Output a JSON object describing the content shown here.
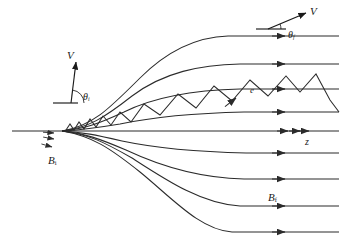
{
  "figure": {
    "background_color": "#ffffff",
    "line_color": "#2b2b2b"
  },
  "labels": {
    "v_initial": "V",
    "theta_initial_base": "θ",
    "theta_initial_sub": "i",
    "v_final": "V",
    "theta_final_base": "θ",
    "theta_final_sub": "f",
    "b_initial_base": "B",
    "b_initial_sub": "i",
    "b_final_base": "B",
    "b_final_sub": "f",
    "electron": "e",
    "axis": "z"
  },
  "chart_data": {
    "type": "line",
    "xlabel": "z",
    "ylabel": "",
    "xlim": [
      0,
      347
    ],
    "ylim": [
      242,
      0
    ],
    "grid": false,
    "legend": "none",
    "pinch_point": [
      62,
      131
    ],
    "field_lines_above": [
      {
        "name": "above-4",
        "asymptote_y": 36,
        "path": "M 62,131 C 92,126 108,110 140,78 C 168,50 196,37 228,36 L 339,36"
      },
      {
        "name": "above-3",
        "asymptote_y": 64,
        "path": "M 62,131 C 88,128 104,118 132,96 C 164,72 200,65 240,64 L 339,64"
      },
      {
        "name": "above-2",
        "asymptote_y": 89,
        "path": "M 62,131 C 84,129 98,124 124,112 C 156,96 198,90 240,89 L 339,89"
      },
      {
        "name": "above-1",
        "asymptote_y": 112,
        "path": "M 62,131 C 82,130 96,128 120,124 C 158,116 200,113 244,112 L 339,112"
      }
    ],
    "field_lines_below": [
      {
        "name": "below-1",
        "asymptote_y": 153,
        "path": "M 62,131 C 82,132 96,135 122,141 C 160,149 202,152 246,153 L 339,153"
      },
      {
        "name": "below-2",
        "asymptote_y": 179,
        "path": "M 62,131 C 84,133 100,139 126,150 C 160,166 200,178 244,179 L 339,179"
      },
      {
        "name": "below-3",
        "asymptote_y": 206,
        "path": "M 62,131 C 88,134 104,142 132,158 C 166,180 202,204 240,206 L 339,206"
      },
      {
        "name": "below-4",
        "asymptote_y": 232,
        "path": "M 62,131 C 92,136 110,148 140,172 C 172,198 200,230 232,232 L 339,232"
      }
    ],
    "axis_line": {
      "name": "z-axis",
      "y": 131,
      "x_start": 12,
      "x_end": 339
    },
    "arrowheads_x": 285,
    "axis_double_arrow_x": [
      288,
      300,
      309
    ],
    "electron_orbit": {
      "description": "Helical orbit projected as a zigzag: tight small-amplitude gyrations at the strong-field pinch growing to large-amplitude, long-pitch oscillations in the weak field region.",
      "points": [
        [
          66,
          130
        ],
        [
          70,
          124
        ],
        [
          74,
          130
        ],
        [
          79,
          122
        ],
        [
          84,
          129
        ],
        [
          90,
          119
        ],
        [
          96,
          127
        ],
        [
          103,
          116
        ],
        [
          111,
          125
        ],
        [
          120,
          112
        ],
        [
          131,
          122
        ],
        [
          144,
          104
        ],
        [
          160,
          115
        ],
        [
          178,
          94
        ],
        [
          196,
          108
        ],
        [
          214,
          86
        ],
        [
          232,
          101
        ],
        [
          250,
          80
        ],
        [
          268,
          96
        ],
        [
          286,
          76
        ],
        [
          300,
          92
        ],
        [
          316,
          74
        ],
        [
          330,
          100
        ],
        [
          339,
          112
        ]
      ],
      "direction_arrow_at": [
        236,
        98
      ],
      "direction_arrow_angle": -38
    },
    "small_arrows_near_pinch": [
      {
        "x": 54,
        "y": 139,
        "angle": 10
      },
      {
        "x": 52,
        "y": 147,
        "angle": 16
      },
      {
        "x": 54,
        "y": 133,
        "angle": 4
      }
    ],
    "vector_initial": {
      "origin": [
        71,
        103
      ],
      "tip": [
        76,
        62
      ],
      "baseline_from": [
        53,
        103
      ],
      "baseline_to": [
        78,
        103
      ],
      "angle_label_at": [
        84,
        97
      ],
      "pitch_angle_deg": 78
    },
    "vector_final": {
      "origin": [
        268,
        29
      ],
      "tip": [
        306,
        13
      ],
      "baseline_from": [
        256,
        29
      ],
      "baseline_to": [
        286,
        29
      ],
      "angle_label_at": [
        289,
        39
      ],
      "pitch_angle_deg": 23
    }
  }
}
